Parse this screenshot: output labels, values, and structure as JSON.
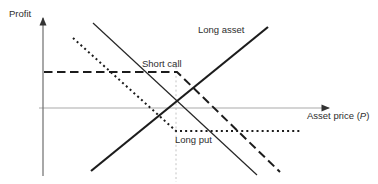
{
  "diagram": {
    "labels": {
      "profit": "Profit",
      "long_asset": "Long asset",
      "short_call": "Short call",
      "long_put": "Long put",
      "asset_price_pre": "Asset price (",
      "asset_price_var": "P",
      "asset_price_post": ")"
    },
    "colors": {
      "payoff_line": "#1c1c1c",
      "horizontal_axis": "#a9a9a9",
      "vertical_axis": "#6e6e6e",
      "strike_guide": "#c4c4c4",
      "background": "#ffffff"
    },
    "lines": [
      {
        "name": "strike-guide-line",
        "style": "guide",
        "arrow": false,
        "points": [
          [
            176,
            62
          ],
          [
            176,
            182
          ]
        ]
      },
      {
        "name": "x-axis",
        "style": "axis-h",
        "arrow": true,
        "points": [
          [
            39,
            108
          ],
          [
            329,
            108
          ]
        ]
      },
      {
        "name": "y-axis",
        "style": "axis-v",
        "arrow": true,
        "points": [
          [
            43,
            176
          ],
          [
            43,
            18
          ]
        ]
      },
      {
        "name": "long-put-line",
        "style": "dotted",
        "arrow": false,
        "points": [
          [
            73,
            38
          ],
          [
            176,
            131
          ],
          [
            301,
            131
          ]
        ]
      },
      {
        "name": "short-call-line",
        "style": "dashed",
        "arrow": false,
        "points": [
          [
            44,
            72
          ],
          [
            177,
            72
          ],
          [
            280,
            172
          ]
        ]
      },
      {
        "name": "short-asset-line",
        "style": "solid-thin",
        "arrow": false,
        "points": [
          [
            93,
            23
          ],
          [
            257,
            175
          ]
        ]
      },
      {
        "name": "long-asset-line",
        "style": "solid-thick",
        "arrow": false,
        "points": [
          [
            91,
            171
          ],
          [
            268,
            27
          ]
        ]
      }
    ]
  }
}
